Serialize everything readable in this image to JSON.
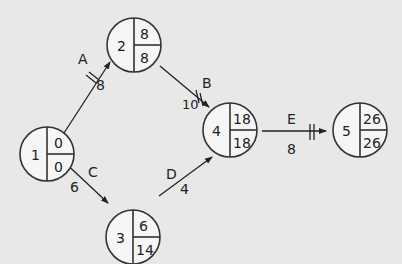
{
  "diagram": {
    "type": "activity-on-arrow network (critical path)",
    "background": "#e8e8e8",
    "nodes": [
      {
        "id": "1",
        "earliest": "0",
        "latest": "0",
        "cx": 47,
        "cy": 154
      },
      {
        "id": "2",
        "earliest": "8",
        "latest": "8",
        "cx": 134,
        "cy": 45
      },
      {
        "id": "3",
        "earliest": "6",
        "latest": "14",
        "cx": 133,
        "cy": 237
      },
      {
        "id": "4",
        "earliest": "18",
        "latest": "18",
        "cx": 230,
        "cy": 130
      },
      {
        "id": "5",
        "earliest": "26",
        "latest": "26",
        "cx": 360,
        "cy": 130
      }
    ],
    "activities": [
      {
        "name": "A",
        "from": "1",
        "to": "2",
        "duration": "8",
        "critical": true
      },
      {
        "name": "B",
        "from": "2",
        "to": "4",
        "duration": "10",
        "critical": true
      },
      {
        "name": "C",
        "from": "1",
        "to": "3",
        "duration": "6",
        "critical": false
      },
      {
        "name": "D",
        "from": "3",
        "to": "4",
        "duration": "4",
        "critical": false
      },
      {
        "name": "E",
        "from": "4",
        "to": "5",
        "duration": "8",
        "critical": true
      }
    ]
  }
}
